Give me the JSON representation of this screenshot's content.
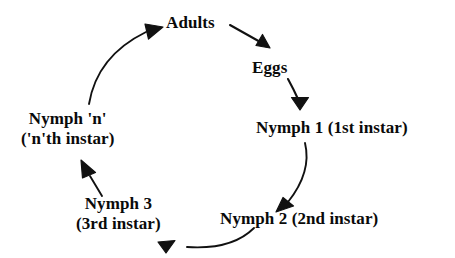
{
  "diagram": {
    "type": "cycle-diagram",
    "background_color": "#ffffff",
    "stroke_color": "#111111",
    "text_color": "#0a0a0a",
    "nodes": [
      {
        "id": "adults",
        "label": "Adults"
      },
      {
        "id": "eggs",
        "label": "Eggs"
      },
      {
        "id": "nymph1",
        "label": "Nymph 1 (1st instar)"
      },
      {
        "id": "nymph2",
        "label": "Nymph 2 (2nd instar)"
      },
      {
        "id": "nymph3",
        "line1": "Nymph 3",
        "line2": "(3rd instar)"
      },
      {
        "id": "nymphn",
        "line1": "Nymph 'n'",
        "line2": "('n'th instar)"
      }
    ],
    "edges": [
      {
        "id": "adults-to-eggs",
        "from": "Adults",
        "to": "Eggs"
      },
      {
        "id": "eggs-to-nymph1",
        "from": "Eggs",
        "to": "Nymph 1 (1st instar)"
      },
      {
        "id": "nymph1-to-nymph2",
        "from": "Nymph 1 (1st instar)",
        "to": "Nymph 2 (2nd instar)"
      },
      {
        "id": "nymph2-to-nymph3",
        "from": "Nymph 2 (2nd instar)",
        "to": "Nymph 3 (3rd instar)"
      },
      {
        "id": "nymph3-to-nymphn",
        "from": "Nymph 3 (3rd instar)",
        "to": "Nymph 'n' ('n'th instar)"
      },
      {
        "id": "nymphn-to-adults",
        "from": "Nymph 'n' ('n'th instar)",
        "to": "Adults"
      }
    ]
  }
}
